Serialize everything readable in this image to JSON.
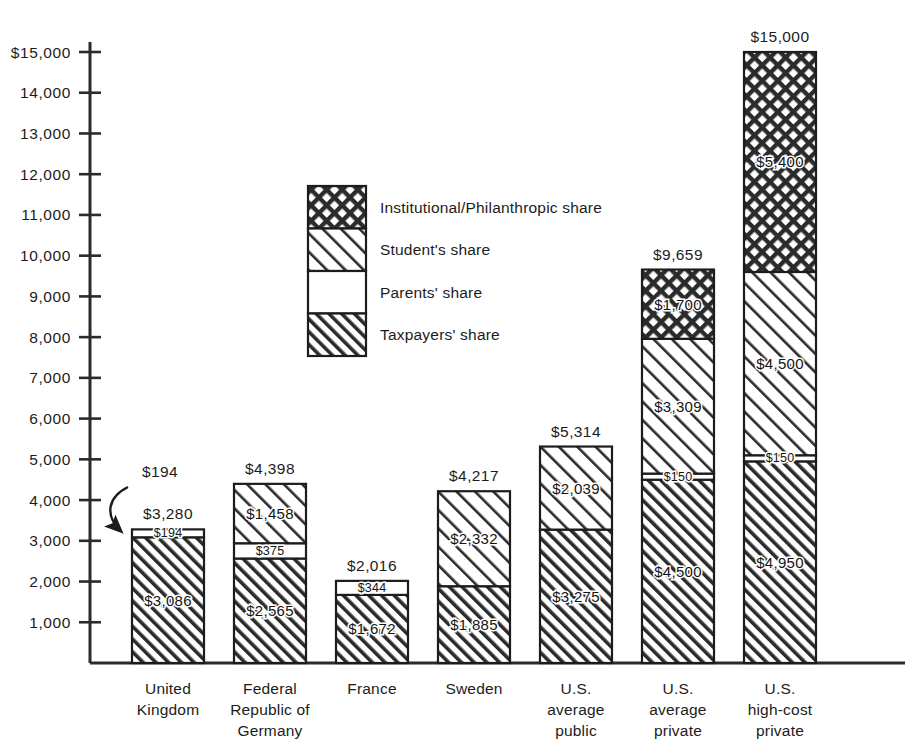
{
  "chart_data": {
    "type": "bar",
    "subtype": "stacked",
    "title": "",
    "subtitle": "",
    "xlabel": "",
    "ylabel": "",
    "ylim": [
      0,
      15000
    ],
    "ytick_step": 1000,
    "grid": false,
    "currency_prefix": "$",
    "legend_position": "inside-center-left",
    "axis_ticks": [
      "$15,000",
      "14,000",
      "13,000",
      "12,000",
      "11,000",
      "10,000",
      "9,000",
      "8,000",
      "7,000",
      "6,000",
      "5,000",
      "4,000",
      "3,000",
      "2,000",
      "1,000"
    ],
    "axis_tick_values": [
      15000,
      14000,
      13000,
      12000,
      11000,
      10000,
      9000,
      8000,
      7000,
      6000,
      5000,
      4000,
      3000,
      2000,
      1000
    ],
    "categories": [
      "United Kingdom",
      "Federal Republic of Germany",
      "France",
      "Sweden",
      "U.S. average public",
      "U.S. average private",
      "U.S. high-cost private"
    ],
    "category_label_lines": [
      [
        "United",
        "Kingdom"
      ],
      [
        "Federal",
        "Republic of",
        "Germany"
      ],
      [
        "France"
      ],
      [
        "Sweden"
      ],
      [
        "U.S.",
        "average",
        "public"
      ],
      [
        "U.S.",
        "average",
        "private"
      ],
      [
        "U.S.",
        "high-cost",
        "private"
      ]
    ],
    "series": [
      {
        "name": "Taxpayers' share",
        "pattern": "dense-diagonal",
        "values": [
          3086,
          2565,
          1672,
          1885,
          3275,
          4500,
          4950
        ],
        "labels": [
          "$3,086",
          "$2,565",
          "$1,672",
          "$1,885",
          "$3,275",
          "$4,500",
          "$4,950"
        ]
      },
      {
        "name": "Parents' share",
        "pattern": "solid-white",
        "values": [
          194,
          375,
          344,
          0,
          0,
          150,
          150
        ],
        "labels": [
          "$194",
          "$375",
          "$344",
          "",
          "",
          "$150",
          "$150"
        ]
      },
      {
        "name": "Student's share",
        "pattern": "light-diagonal",
        "values": [
          0,
          1458,
          0,
          2332,
          2039,
          3309,
          4500
        ],
        "labels": [
          "",
          "$1,458",
          "",
          "$2,332",
          "$2,039",
          "$3,309",
          "$4,500"
        ]
      },
      {
        "name": "Institutional/Philanthropic share",
        "pattern": "cross-hatch",
        "values": [
          0,
          0,
          0,
          0,
          0,
          1700,
          5400
        ],
        "labels": [
          "",
          "",
          "",
          "",
          "",
          "$1,700",
          "$5,400"
        ]
      }
    ],
    "totals": [
      3280,
      4398,
      2016,
      4217,
      5314,
      9659,
      15000
    ],
    "total_labels": [
      "$3,280",
      "$4,398",
      "$2,016",
      "$4,217",
      "$5,314",
      "$9,659",
      "$15,000"
    ],
    "annotations": [
      {
        "text": "$194",
        "target_series": "Parents' share",
        "target_category": "United Kingdom",
        "style": "curved-arrow"
      }
    ],
    "legend": [
      {
        "label": "Institutional/Philanthropic share",
        "pattern": "cross-hatch"
      },
      {
        "label": "Student's share",
        "pattern": "light-diagonal"
      },
      {
        "label": "Parents' share",
        "pattern": "solid-white"
      },
      {
        "label": "Taxpayers' share",
        "pattern": "dense-diagonal"
      }
    ]
  },
  "colors": {
    "background": "#ffffff",
    "ink": "#1c1c1c",
    "hatch": "#2b2b2b",
    "axis": "#2b2b2b"
  }
}
